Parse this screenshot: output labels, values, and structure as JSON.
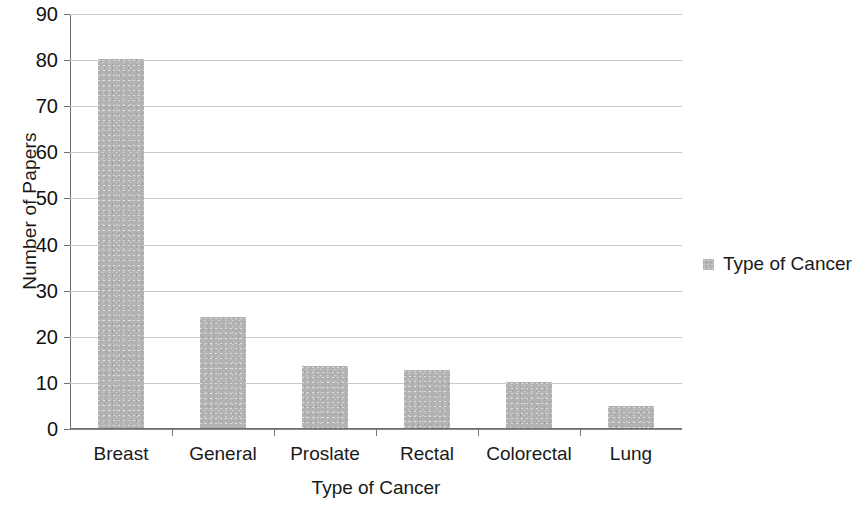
{
  "chart_data": {
    "type": "bar",
    "title": "",
    "xlabel": "Type of Cancer",
    "ylabel": "Number of Papers",
    "categories": [
      "Breast",
      "General",
      "Proslate",
      "Rectal",
      "Colorectal",
      "Lung"
    ],
    "values": [
      80,
      24,
      13.5,
      12.5,
      10,
      4.7
    ],
    "series": [
      {
        "name": "Type of Cancer",
        "values": [
          80,
          24,
          13.5,
          12.5,
          10,
          4.7
        ]
      }
    ],
    "ylim": [
      0,
      90
    ],
    "yticks": [
      0,
      10,
      20,
      30,
      40,
      50,
      60,
      70,
      80,
      90
    ],
    "ytick_labels": [
      "0",
      "10",
      "20",
      "30",
      "40",
      "50",
      "60",
      "70",
      "80",
      "90"
    ],
    "grid": true,
    "grid_axis": "y",
    "legend": {
      "position": "right",
      "entries": [
        {
          "label": "Type of Cancer",
          "color": "#b3b3b3"
        }
      ]
    },
    "colors": {
      "bar_fill": "#b3b3b3",
      "gridline": "#c9c9c9",
      "axis": "#6e6e6e",
      "text": "#1a1a1a",
      "background": "#ffffff"
    }
  }
}
